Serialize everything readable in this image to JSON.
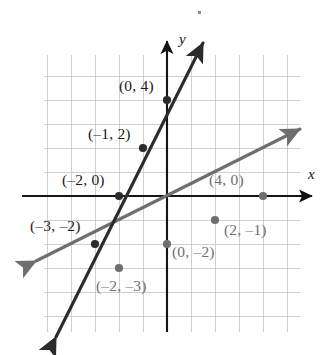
{
  "figure": {
    "kind": "coordinate-plane-graph",
    "background": "#ffffff",
    "speck_mark": "·"
  },
  "axes": {
    "x_axis_label": "x",
    "y_axis_label": "y",
    "x_axis_color": "#141414",
    "y_axis_color": "#141414",
    "grid_color": "#c9c9cf",
    "grid_visible": true,
    "grid_step_units": 1,
    "origin_px": {
      "x": 167,
      "y": 196
    },
    "pixels_per_unit": 24,
    "xlim": [
      -5.2,
      6.1
    ],
    "ylim": [
      -6.2,
      5.6
    ]
  },
  "chart_data": {
    "type": "line",
    "title": "",
    "xlabel": "x",
    "ylabel": "y",
    "xlim": [
      -5.2,
      6.1
    ],
    "ylim": [
      -6.2,
      5.6
    ],
    "grid": true,
    "legend": "none",
    "series": [
      {
        "name": "steep-line",
        "equation": "y = 2x + 4",
        "slope": 2,
        "intercept": 4,
        "color": "#2b2b2b",
        "arrows": "both",
        "points": [
          {
            "x": -3,
            "y": -2,
            "label": "(–3, –2)"
          },
          {
            "x": -2,
            "y": 0,
            "label": "(–2, 0)"
          },
          {
            "x": -1,
            "y": 2,
            "label": "(–1, 2)"
          },
          {
            "x": 0,
            "y": 4,
            "label": "(0, 4)"
          }
        ]
      },
      {
        "name": "shallow-line",
        "equation": "y = 0.5x - 2",
        "slope": 0.5,
        "intercept": -2,
        "color": "#6f6f6f",
        "arrows": "both",
        "points": [
          {
            "x": -2,
            "y": -3,
            "label": "(–2, –3)"
          },
          {
            "x": 0,
            "y": -2,
            "label": "(0, –2)"
          },
          {
            "x": 2,
            "y": -1,
            "label": "(2, –1)"
          },
          {
            "x": 4,
            "y": 0,
            "label": "(4, 0)"
          }
        ]
      }
    ]
  },
  "labels": [
    {
      "id": "p04",
      "text": "(0, 4)",
      "color": "dark",
      "left": 119,
      "top": 78
    },
    {
      "id": "pm12",
      "text": "(–1, 2)",
      "color": "dark",
      "left": 88,
      "top": 126
    },
    {
      "id": "pm20",
      "text": "(–2, 0)",
      "color": "dark",
      "left": 62,
      "top": 172
    },
    {
      "id": "pm3m2",
      "text": "(–3, –2)",
      "color": "dark",
      "left": 30,
      "top": 218
    },
    {
      "id": "p40",
      "text": "(4, 0)",
      "color": "gray",
      "left": 209,
      "top": 172
    },
    {
      "id": "p2m1",
      "text": "(2, –1)",
      "color": "gray",
      "left": 224,
      "top": 222
    },
    {
      "id": "p0m2",
      "text": "(0, –2)",
      "color": "gray",
      "left": 172,
      "top": 244
    },
    {
      "id": "pm2m3",
      "text": "(–2, –3)",
      "color": "gray",
      "left": 96,
      "top": 278
    }
  ]
}
